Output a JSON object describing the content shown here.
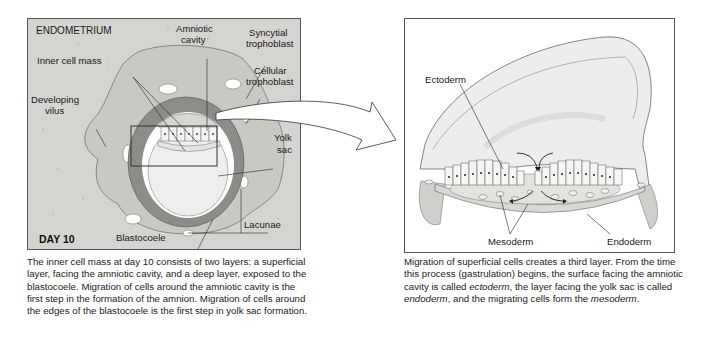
{
  "left_panel": {
    "day_label": "DAY 10",
    "labels": {
      "endometrium": "ENDOMETRIUM",
      "amniotic_cavity_1": "Amniotic",
      "amniotic_cavity_2": "cavity",
      "syncytial_1": "Syncytial",
      "syncytial_2": "trophoblast",
      "inner_cell_mass": "Inner cell mass",
      "cellular_1": "Cellular",
      "cellular_2": "trophoblast",
      "developing_1": "Developing",
      "developing_2": "vilus",
      "yolk_1": "Yolk",
      "yolk_2": "sac",
      "lacunae": "Lacunae",
      "blastocoele": "Blastocoele"
    },
    "caption": "The inner cell mass at day 10 consists of two layers: a superficial layer, facing the amniotic cavity, and a deep layer, exposed to the blastocoele. Migration of cells around the amniotic cavity is the first step in the formation of the amnion. Migration of cells around the edges of the blastocoele is the first step in yolk sac formation.",
    "colors": {
      "endometrium_bg": "#d4d4d0",
      "syncytial": "#c9c9c4",
      "cellular": "#8c8c88",
      "cavity": "#ffffff"
    }
  },
  "right_panel": {
    "day_label": "DAY 12",
    "labels": {
      "ectoderm": "Ectoderm",
      "mesoderm": "Mesoderm",
      "endoderm": "Endoderm"
    },
    "caption_parts": [
      {
        "text": "Migration of superficial cells creates a third layer. From the time this process (gastrulation) begins, the surface facing the amniotic cavity is called ",
        "italic": false
      },
      {
        "text": "ectoderm",
        "italic": true
      },
      {
        "text": ", the layer facing the yolk sac is called ",
        "italic": false
      },
      {
        "text": "endoderm",
        "italic": true
      },
      {
        "text": ", and the migrating cells form the ",
        "italic": false
      },
      {
        "text": "mesoderm",
        "italic": true
      },
      {
        "text": ".",
        "italic": false
      }
    ]
  },
  "connector": {
    "icon": "zoom-arrow-icon"
  }
}
